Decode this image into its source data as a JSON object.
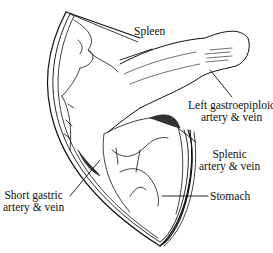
{
  "figure": {
    "labels": {
      "spleen": {
        "lines": [
          "Spleen"
        ]
      },
      "left_gastroepiploic": {
        "lines": [
          "Left gastroepiploic",
          "artery & vein"
        ]
      },
      "splenic": {
        "lines": [
          "Splenic",
          "artery & vein"
        ]
      },
      "short_gastric": {
        "lines": [
          "Short gastric",
          "artery & vein"
        ]
      },
      "stomach": {
        "lines": [
          "Stomach"
        ]
      }
    },
    "colors": {
      "ink": "#111111",
      "background": "#ffffff",
      "shade": "#333333"
    }
  }
}
